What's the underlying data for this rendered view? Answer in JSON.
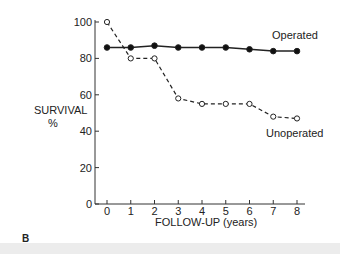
{
  "panel_label": "B",
  "chart_data": {
    "type": "line",
    "title": "",
    "xlabel": "FOLLOW-UP (years)",
    "ylabel": "SURVIVAL\n%",
    "ylabel_line1": "SURVIVAL",
    "ylabel_line2": "%",
    "x": [
      0,
      1,
      2,
      3,
      4,
      5,
      6,
      7,
      8
    ],
    "x_ticks": [
      "0",
      "1",
      "2",
      "3",
      "4",
      "5",
      "6",
      "7",
      "8"
    ],
    "y_ticks": [
      "0",
      "20",
      "40",
      "60",
      "80",
      "100"
    ],
    "ylim": [
      0,
      100
    ],
    "xlim": [
      0,
      8
    ],
    "grid": false,
    "series": [
      {
        "name": "Operated",
        "style": "solid",
        "marker": "filled-circle",
        "values": [
          86,
          86,
          87,
          86,
          86,
          86,
          85,
          84,
          84
        ]
      },
      {
        "name": "Unoperated",
        "style": "dashed",
        "marker": "open-circle",
        "values": [
          100,
          80,
          80,
          58,
          55,
          55,
          55,
          48,
          47
        ]
      }
    ],
    "annotations": [
      {
        "text": "Operated",
        "near_series": "Operated"
      },
      {
        "text": "Unoperated",
        "near_series": "Unoperated"
      }
    ]
  }
}
